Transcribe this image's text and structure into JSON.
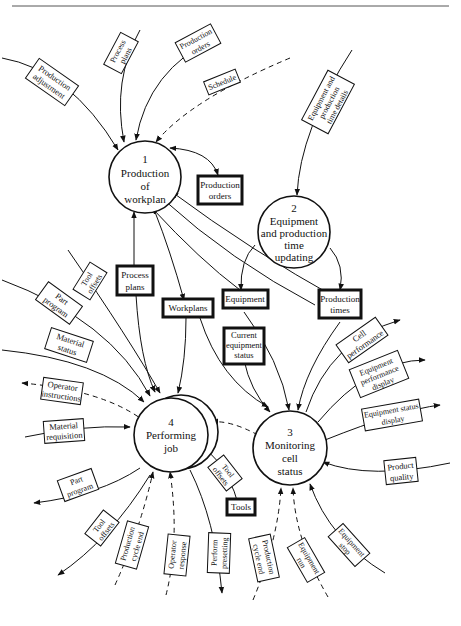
{
  "page": {
    "header_rule": true
  },
  "processes": [
    {
      "id": "1",
      "lines": [
        "Production",
        "of",
        "workplan"
      ]
    },
    {
      "id": "2",
      "lines": [
        "Equipment",
        "and production",
        "time",
        "updating"
      ]
    },
    {
      "id": "3",
      "lines": [
        "Monitoring",
        "cell",
        "status"
      ]
    },
    {
      "id": "4",
      "lines": [
        "Performing",
        "job"
      ]
    }
  ],
  "data_stores": {
    "production_orders": [
      "Production",
      "orders"
    ],
    "process_plans": [
      "Process",
      "plans"
    ],
    "workplans": [
      "Workplans"
    ],
    "equipment": [
      "Equipment"
    ],
    "production_times": [
      "Production",
      "times"
    ],
    "current_equipment_status": [
      "Current",
      "equipment",
      "status"
    ],
    "tools": [
      "Tools"
    ]
  },
  "flows": {
    "production_adjustment": [
      "Production",
      "adjustment"
    ],
    "process_plans_in": [
      "Process",
      "plans"
    ],
    "production_orders_in": [
      "Production",
      "orders"
    ],
    "schedule": [
      "Schedule"
    ],
    "equipment_time_details": [
      "Equipment and",
      "production",
      "time details"
    ],
    "tool_offsets_in": [
      "Tool",
      "offsets"
    ],
    "part_program_in": [
      "Part",
      "program"
    ],
    "material_status": [
      "Material",
      "status"
    ],
    "operator_instructions": [
      "Operator",
      "instructions"
    ],
    "material_requisition": [
      "Material",
      "requisition"
    ],
    "part_program_out": [
      "Part",
      "program"
    ],
    "tool_offsets_out": [
      "Tool",
      "offsets"
    ],
    "production_cycle_end_4": [
      "Production",
      "cycle end"
    ],
    "operator_response": [
      "Operator",
      "response"
    ],
    "perform_presetting": [
      "Perform",
      "presetting"
    ],
    "tool_offsets_tools": [
      "Tool",
      "offsets"
    ],
    "cell_performance": [
      "Cell",
      "performance"
    ],
    "equipment_performance_display": [
      "Equipment",
      "performance",
      "display"
    ],
    "equipment_status_display": [
      "Equipment status",
      "display"
    ],
    "product_quality": [
      "Product",
      "quality"
    ],
    "equipment_stop": [
      "Equipment",
      "stop"
    ],
    "equipment_run": [
      "Equipment",
      "run"
    ],
    "production_cycle_end_3": [
      "Production",
      "cycle end"
    ]
  }
}
